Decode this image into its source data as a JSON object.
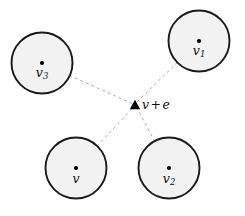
{
  "figure": {
    "width": 245,
    "height": 216,
    "background": "#ffffff"
  },
  "style": {
    "circle_fill": "#f2f2f2",
    "circle_stroke": "#1a1a1a",
    "circle_stroke_width": 1.9,
    "dash_color": "#b0b0b0",
    "dash_width": 1.0,
    "dash_pattern": "3 3",
    "dot_color": "#000000",
    "dot_radius": 2.1,
    "marker_color": "#000000"
  },
  "nodes": [
    {
      "name": "v3",
      "label": "v",
      "subscript": "3",
      "cx": 42,
      "cy": 63,
      "r": 30.5,
      "label_x": 42,
      "label_y": 66.5
    },
    {
      "name": "v1",
      "label": "v",
      "subscript": "1",
      "cx": 199,
      "cy": 41,
      "r": 30.5,
      "label_x": 199,
      "label_y": 44.5
    },
    {
      "name": "v",
      "label": "v",
      "subscript": "",
      "cx": 76,
      "cy": 168,
      "r": 30.5,
      "label_x": 76,
      "label_y": 172.5
    },
    {
      "name": "v2",
      "label": "v",
      "subscript": "2",
      "cx": 169,
      "cy": 168,
      "r": 30.5,
      "label_x": 169,
      "label_y": 172.5
    }
  ],
  "center": {
    "name": "v-plus-e",
    "marker": "triangle-up-marker",
    "marker_x": 135,
    "marker_y": 105,
    "marker_size": 5.2,
    "label_var": "v",
    "label_op": "+",
    "label_var2": "e",
    "label_text": "v + e",
    "label_x": 142,
    "label_y": 99
  },
  "edges": [
    {
      "name": "edge-v3-center",
      "from": "v3",
      "x1": 42,
      "y1": 63,
      "x2": 133,
      "y2": 104
    },
    {
      "name": "edge-v1-center",
      "from": "v1",
      "x1": 199,
      "y1": 41,
      "x2": 136,
      "y2": 103
    },
    {
      "name": "edge-v-center",
      "from": "v",
      "x1": 76,
      "y1": 168,
      "x2": 133,
      "y2": 108
    },
    {
      "name": "edge-v2-center",
      "from": "v2",
      "x1": 169,
      "y1": 168,
      "x2": 137,
      "y2": 108
    }
  ]
}
